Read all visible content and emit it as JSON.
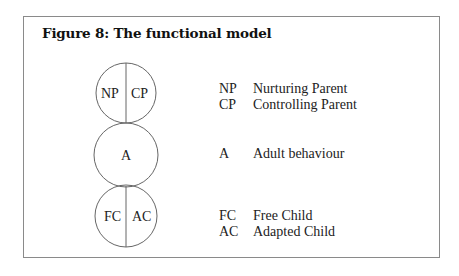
{
  "figure": {
    "title": "Figure 8: The functional model",
    "circles": [
      {
        "id": "parent",
        "left": "NP",
        "right": "CP",
        "split": true
      },
      {
        "id": "adult",
        "label": "A",
        "split": false
      },
      {
        "id": "child",
        "left": "FC",
        "right": "AC",
        "split": true
      }
    ],
    "legend": [
      {
        "abbr": "NP",
        "desc": "Nurturing Parent"
      },
      {
        "abbr": "CP",
        "desc": "Controlling Parent"
      },
      {
        "abbr": "A",
        "desc": "Adult behaviour"
      },
      {
        "abbr": "FC",
        "desc": "Free Child"
      },
      {
        "abbr": "AC",
        "desc": "Adapted Child"
      }
    ],
    "colors": {
      "line": "#666666",
      "text": "#222222",
      "frame": "#8a8a8a"
    }
  }
}
